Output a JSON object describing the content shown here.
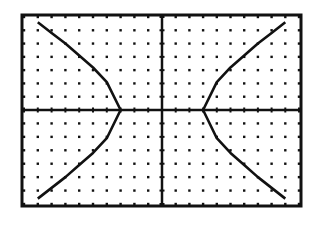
{
  "chart_data": {
    "type": "line",
    "title": "",
    "xlabel": "",
    "ylabel": "",
    "grid": "dots",
    "xlim": [
      -10,
      10
    ],
    "ylim": [
      -7,
      7
    ],
    "tick_spacing": 1,
    "vertices": [
      [
        -3,
        0
      ],
      [
        3,
        0
      ]
    ],
    "series": [
      {
        "name": "upper-right branch",
        "x": [
          3,
          4,
          5,
          6,
          7,
          8,
          9,
          10
        ],
        "y": [
          0,
          2.1,
          3.2,
          4.1,
          5.0,
          5.8,
          6.6,
          7.3
        ]
      },
      {
        "name": "lower-right branch",
        "x": [
          3,
          4,
          5,
          6,
          7,
          8,
          9,
          10
        ],
        "y": [
          0,
          -2.1,
          -3.2,
          -4.1,
          -5.0,
          -5.8,
          -6.6,
          -7.3
        ]
      },
      {
        "name": "upper-left branch",
        "x": [
          -3,
          -4,
          -5,
          -6,
          -7,
          -8,
          -9,
          -10
        ],
        "y": [
          0,
          2.1,
          3.2,
          4.1,
          5.0,
          5.8,
          6.6,
          7.3
        ]
      },
      {
        "name": "lower-left branch",
        "x": [
          -3,
          -4,
          -5,
          -6,
          -7,
          -8,
          -9,
          -10
        ],
        "y": [
          0,
          -2.1,
          -3.2,
          -4.1,
          -5.0,
          -5.8,
          -6.6,
          -7.3
        ]
      }
    ],
    "colors": {
      "background": "#ffffff",
      "ink": "#111111"
    }
  }
}
